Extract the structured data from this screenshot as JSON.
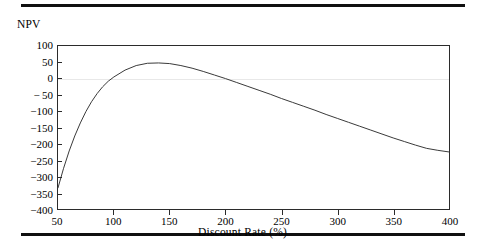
{
  "figure": {
    "top_rule": "horizontal-rule",
    "bottom_rule": "horizontal-rule"
  },
  "chart_data": {
    "type": "line",
    "title": "",
    "ylabel": "NPV",
    "xlabel": "Discount Rate (%)",
    "xlim": [
      50,
      400
    ],
    "ylim": [
      -400,
      100
    ],
    "xticks": [
      50,
      100,
      150,
      200,
      250,
      300,
      350,
      400
    ],
    "xtick_labels": [
      "50",
      "100",
      "150",
      "200",
      "250",
      "300",
      "350",
      "400"
    ],
    "yticks": [
      100,
      50,
      0,
      -50,
      -100,
      -150,
      -200,
      -250,
      -300,
      -350,
      -400
    ],
    "ytick_labels": [
      "100",
      "50",
      "0",
      "− 50",
      "−100",
      "−150",
      "−200",
      "−250",
      "−300",
      "−350",
      "−400"
    ],
    "grid": false,
    "zero_reference_line": true,
    "zero_reference_color": "#e8e8e8",
    "legend": null,
    "line_color": "#3a3a3a",
    "series": [
      {
        "name": "NPV",
        "x": [
          50,
          55,
          60,
          65,
          70,
          75,
          80,
          85,
          90,
          95,
          100,
          110,
          120,
          130,
          140,
          150,
          160,
          170,
          180,
          190,
          200,
          210,
          220,
          230,
          240,
          250,
          260,
          270,
          280,
          290,
          300,
          310,
          320,
          330,
          340,
          350,
          360,
          370,
          380,
          390,
          400
        ],
        "values": [
          -335,
          -275,
          -222,
          -176,
          -136,
          -101,
          -71,
          -46,
          -25,
          -8,
          5,
          26,
          40,
          47,
          48,
          46,
          40,
          32,
          22,
          11,
          0,
          -12,
          -24,
          -36,
          -48,
          -61,
          -73,
          -85,
          -97,
          -110,
          -122,
          -134,
          -146,
          -158,
          -170,
          -182,
          -193,
          -204,
          -214,
          -220,
          -225
        ]
      }
    ]
  }
}
